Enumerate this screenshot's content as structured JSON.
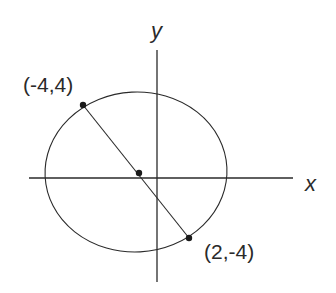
{
  "diagram": {
    "type": "ellipse-with-chord",
    "axes": {
      "x_label": "x",
      "y_label": "y"
    },
    "points": [
      {
        "label": "(-4,4)",
        "x": -4,
        "y": 4,
        "role": "endpoint"
      },
      {
        "label": "(2,-4)",
        "x": 2,
        "y": -4,
        "role": "endpoint"
      },
      {
        "label": "",
        "x": -1,
        "y": 0,
        "role": "midpoint"
      }
    ],
    "colors": {
      "stroke": "#2a2a2a",
      "background": "#ffffff"
    }
  }
}
